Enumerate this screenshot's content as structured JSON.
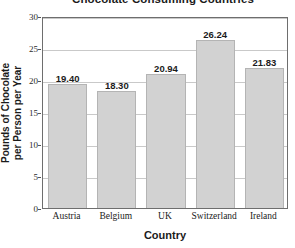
{
  "chart_data": {
    "type": "bar",
    "title": "Chocolate Consuming Countries",
    "xlabel": "Country",
    "ylabel": "Pounds of Chocolate per Person per Year",
    "ylabel_lines": [
      "Pounds of Chocolate",
      "per Person per Year"
    ],
    "categories": [
      "Austria",
      "Belgium",
      "UK",
      "Switzerland",
      "Ireland"
    ],
    "values": [
      19.4,
      18.3,
      20.94,
      26.24,
      21.83
    ],
    "value_labels": [
      "19.40",
      "18.30",
      "20.94",
      "26.24",
      "21.83"
    ],
    "ylim": [
      0,
      30
    ],
    "yticks": [
      0,
      5,
      10,
      15,
      20,
      25,
      30
    ],
    "ytick_labels": [
      "0",
      "5",
      "10",
      "15",
      "20",
      "25",
      "30"
    ],
    "grid": true,
    "legend": false,
    "bar_color": "#d2d2d2",
    "bar_border_color": "#b4b4b4",
    "grid_color": "#c9c9c9",
    "axis_color": "#6e6e6e",
    "text_color": "#1b1b1b",
    "background": "#ffffff"
  }
}
